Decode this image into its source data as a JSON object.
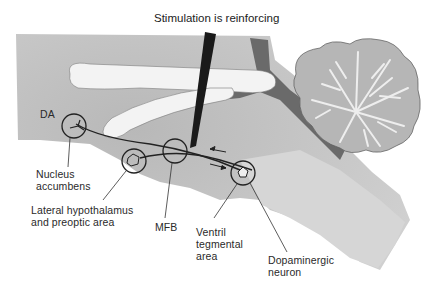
{
  "diagram": {
    "title": "Stimulation is reinforcing",
    "labels": {
      "da": "DA",
      "nucleus_accumbens": "Nucleus\naccumbens",
      "lateral_hypothalamus": "Lateral hypothalamus\nand preoptic area",
      "mfb": "MFB",
      "vta": "Ventril\ntegmental\narea",
      "dopaminergic_neuron": "Dopaminergic\nneuron"
    },
    "colors": {
      "tissue": "#c4c4c4",
      "tissue_light": "#dadada",
      "tissue_dark": "#6e6e6e",
      "ventricle": "#f4f4f4",
      "electrode": "#1a1a1a",
      "pathway": "#222222",
      "cerebellum": "#b8b8b8",
      "cerebellum_white_matter": "#eeeeee"
    }
  }
}
